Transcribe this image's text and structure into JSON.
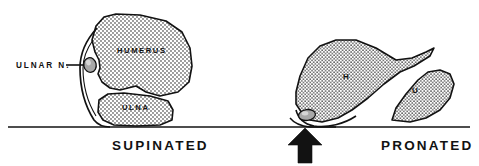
{
  "figure": {
    "width": 479,
    "height": 166,
    "background_color": "#ffffff",
    "ink_color": "#121212",
    "stipple_color": "#121212",
    "nerve_fill_color": "#a8a8a8"
  },
  "panels": [
    {
      "id": "supinated",
      "caption": "SUPINATED",
      "caption_x": 112,
      "caption_y": 150,
      "labels": [
        {
          "name": "ulnar-nerve",
          "text": "ULNAR N.",
          "x": 16,
          "y": 68
        },
        {
          "name": "humerus",
          "text": "HUMERUS",
          "x": 117,
          "y": 53
        },
        {
          "name": "ulna",
          "text": "ULNA",
          "x": 122,
          "y": 110
        }
      ],
      "leader_line": {
        "from_x": 66,
        "from_y": 65,
        "to_x": 84,
        "to_y": 65
      },
      "nerve": {
        "cx": 90,
        "cy": 65,
        "rx": 6.2,
        "ry": 7.4,
        "rotation": -12,
        "compressed": false
      }
    },
    {
      "id": "pronated",
      "caption": "PRONATED",
      "caption_x": 381,
      "caption_y": 150,
      "labels": [
        {
          "name": "humerus-abbrev",
          "text": "H",
          "x": 343,
          "y": 79
        },
        {
          "name": "ulna-abbrev",
          "text": "U",
          "x": 412,
          "y": 93
        }
      ],
      "arrow": {
        "tip_x": 305,
        "tip_y": 128,
        "base_y": 163,
        "half_width": 17,
        "shaft_half_width": 7,
        "direction": "up"
      },
      "nerve": {
        "cx": 307,
        "cy": 115,
        "rx": 8.5,
        "ry": 5.4,
        "rotation": -8,
        "compressed": true
      }
    }
  ],
  "baseline": {
    "name": "table-surface-line",
    "x1": 8,
    "x2": 470,
    "y": 127,
    "thickness": 1.6
  },
  "legend_notes": {
    "supinated_note": "Ulnar nerve sits in cubital groove, protected",
    "pronated_note": "Ulnar nerve compressed between bone and surface"
  }
}
